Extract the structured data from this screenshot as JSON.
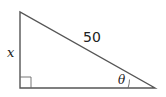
{
  "diagram": {
    "type": "right-triangle",
    "hypotenuse_label": "50",
    "vertical_side_label": "x",
    "angle_label": "θ",
    "right_angle_marker": true,
    "stroke_color": "#555555"
  }
}
